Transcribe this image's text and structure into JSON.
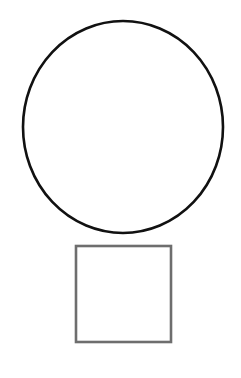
{
  "canvas": {
    "width": 241,
    "height": 378,
    "background_color": "#ffffff",
    "title": "Two geometric outline shapes"
  },
  "shapes": [
    {
      "id": "circle",
      "name": "circle-outline",
      "type": "ellipse",
      "label": "Circle",
      "stroke_color": "#111111",
      "stroke_width": 2.6,
      "fill": "none",
      "center_x": 123,
      "center_y": 127,
      "radius_x": 100,
      "radius_y": 106,
      "bounds": {
        "left": 23,
        "top": 21,
        "right": 223,
        "bottom": 233,
        "width": 200,
        "height": 212
      }
    },
    {
      "id": "square",
      "name": "square-outline",
      "type": "rect",
      "label": "Square",
      "stroke_color": "#6e6e6e",
      "stroke_width": 2.6,
      "fill": "none",
      "x": 76,
      "y": 246,
      "width": 95,
      "height": 96,
      "bounds": {
        "left": 76,
        "top": 246,
        "right": 171,
        "bottom": 342,
        "width": 95,
        "height": 96
      }
    }
  ]
}
